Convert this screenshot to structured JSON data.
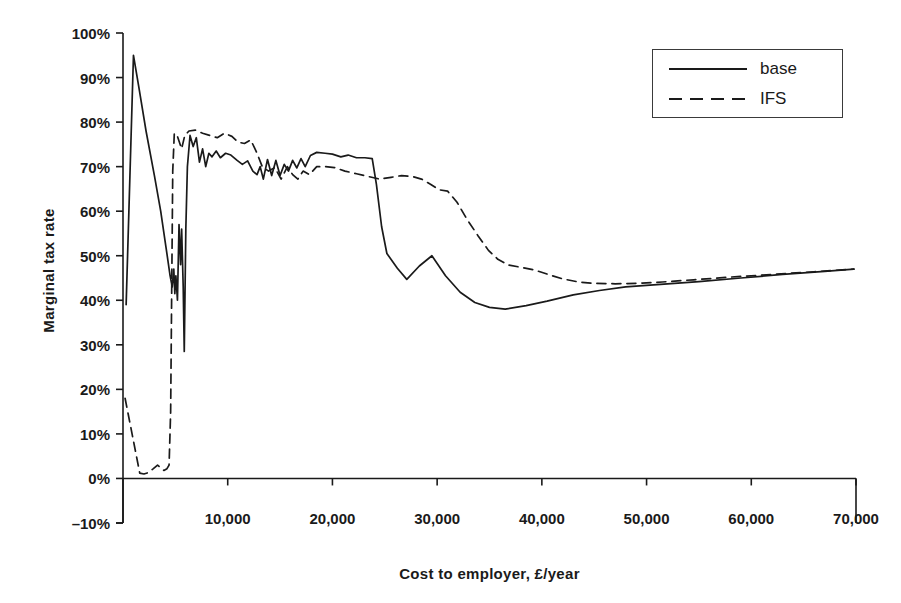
{
  "chart_data": {
    "type": "line",
    "title": "",
    "xlabel": "Cost to employer, £/year",
    "ylabel": "Marginal tax rate",
    "xlim": [
      0,
      70000
    ],
    "ylim": [
      -0.1,
      1.0
    ],
    "grid": false,
    "legend_position": "top-right",
    "x_tick_labels": [
      "10,000",
      "20,000",
      "30,000",
      "40,000",
      "50,000",
      "60,000",
      "70,000"
    ],
    "x_ticks": [
      10000,
      20000,
      30000,
      40000,
      50000,
      60000,
      70000
    ],
    "y_tick_labels": [
      "100%",
      "90%",
      "80%",
      "70%",
      "60%",
      "50%",
      "40%",
      "30%",
      "20%",
      "10%",
      "0%",
      "–10%"
    ],
    "y_ticks": [
      1.0,
      0.9,
      0.8,
      0.7,
      0.6,
      0.5,
      0.4,
      0.3,
      0.2,
      0.1,
      0.0,
      -0.1
    ],
    "series": [
      {
        "name": "base",
        "style": "solid",
        "color": "#1a1a1a",
        "points": [
          [
            300,
            0.39
          ],
          [
            1000,
            0.95
          ],
          [
            1500,
            0.88
          ],
          [
            2200,
            0.78
          ],
          [
            3000,
            0.68
          ],
          [
            3600,
            0.6
          ],
          [
            4100,
            0.52
          ],
          [
            4500,
            0.455
          ],
          [
            4700,
            0.43
          ],
          [
            4850,
            0.47
          ],
          [
            4950,
            0.415
          ],
          [
            5050,
            0.455
          ],
          [
            5200,
            0.4
          ],
          [
            5350,
            0.57
          ],
          [
            5500,
            0.48
          ],
          [
            5600,
            0.56
          ],
          [
            5750,
            0.43
          ],
          [
            5850,
            0.285
          ],
          [
            6000,
            0.56
          ],
          [
            6150,
            0.7
          ],
          [
            6400,
            0.77
          ],
          [
            6700,
            0.745
          ],
          [
            7000,
            0.765
          ],
          [
            7300,
            0.71
          ],
          [
            7600,
            0.74
          ],
          [
            7900,
            0.7
          ],
          [
            8200,
            0.73
          ],
          [
            8500,
            0.722
          ],
          [
            8900,
            0.735
          ],
          [
            9300,
            0.72
          ],
          [
            9800,
            0.73
          ],
          [
            10300,
            0.726
          ],
          [
            10900,
            0.714
          ],
          [
            11400,
            0.705
          ],
          [
            11900,
            0.713
          ],
          [
            12400,
            0.69
          ],
          [
            12800,
            0.682
          ],
          [
            13100,
            0.7
          ],
          [
            13400,
            0.672
          ],
          [
            13800,
            0.716
          ],
          [
            14200,
            0.68
          ],
          [
            14600,
            0.714
          ],
          [
            15000,
            0.68
          ],
          [
            15400,
            0.705
          ],
          [
            15800,
            0.69
          ],
          [
            16200,
            0.714
          ],
          [
            16600,
            0.697
          ],
          [
            17000,
            0.718
          ],
          [
            17400,
            0.7
          ],
          [
            17900,
            0.725
          ],
          [
            18500,
            0.732
          ],
          [
            19300,
            0.73
          ],
          [
            20000,
            0.728
          ],
          [
            20800,
            0.722
          ],
          [
            21500,
            0.726
          ],
          [
            22300,
            0.72
          ],
          [
            23100,
            0.72
          ],
          [
            23800,
            0.718
          ],
          [
            24200,
            0.66
          ],
          [
            24700,
            0.565
          ],
          [
            25200,
            0.505
          ],
          [
            26200,
            0.472
          ],
          [
            27100,
            0.447
          ],
          [
            28300,
            0.477
          ],
          [
            29500,
            0.5
          ],
          [
            30800,
            0.455
          ],
          [
            32200,
            0.418
          ],
          [
            33600,
            0.395
          ],
          [
            35000,
            0.384
          ],
          [
            36500,
            0.38
          ],
          [
            38500,
            0.388
          ],
          [
            40500,
            0.398
          ],
          [
            43000,
            0.412
          ],
          [
            45500,
            0.422
          ],
          [
            48000,
            0.43
          ],
          [
            51000,
            0.435
          ],
          [
            55000,
            0.442
          ],
          [
            59000,
            0.45
          ],
          [
            63000,
            0.458
          ],
          [
            67000,
            0.465
          ],
          [
            69800,
            0.47
          ]
        ]
      },
      {
        "name": "IFS",
        "style": "dashed",
        "color": "#1a1a1a",
        "points": [
          [
            200,
            0.18
          ],
          [
            700,
            0.12
          ],
          [
            1200,
            0.06
          ],
          [
            1600,
            0.012
          ],
          [
            2000,
            0.01
          ],
          [
            2400,
            0.013
          ],
          [
            2900,
            0.022
          ],
          [
            3300,
            0.03
          ],
          [
            3600,
            0.024
          ],
          [
            3900,
            0.018
          ],
          [
            4200,
            0.022
          ],
          [
            4400,
            0.03
          ],
          [
            4550,
            0.15
          ],
          [
            4650,
            0.42
          ],
          [
            4750,
            0.69
          ],
          [
            4900,
            0.775
          ],
          [
            5200,
            0.768
          ],
          [
            5600,
            0.74
          ],
          [
            5900,
            0.77
          ],
          [
            6300,
            0.78
          ],
          [
            6900,
            0.782
          ],
          [
            7600,
            0.775
          ],
          [
            8300,
            0.77
          ],
          [
            9000,
            0.765
          ],
          [
            9700,
            0.775
          ],
          [
            10400,
            0.768
          ],
          [
            11000,
            0.755
          ],
          [
            11600,
            0.752
          ],
          [
            12200,
            0.76
          ],
          [
            12800,
            0.73
          ],
          [
            13300,
            0.7
          ],
          [
            13900,
            0.69
          ],
          [
            14500,
            0.698
          ],
          [
            15100,
            0.672
          ],
          [
            15700,
            0.7
          ],
          [
            16200,
            0.682
          ],
          [
            16700,
            0.672
          ],
          [
            17200,
            0.69
          ],
          [
            17800,
            0.682
          ],
          [
            18500,
            0.7
          ],
          [
            19300,
            0.7
          ],
          [
            20200,
            0.698
          ],
          [
            21200,
            0.69
          ],
          [
            22300,
            0.684
          ],
          [
            23400,
            0.678
          ],
          [
            24500,
            0.672
          ],
          [
            25600,
            0.676
          ],
          [
            26600,
            0.68
          ],
          [
            27600,
            0.678
          ],
          [
            28500,
            0.672
          ],
          [
            29400,
            0.66
          ],
          [
            30200,
            0.648
          ],
          [
            31000,
            0.645
          ],
          [
            31900,
            0.62
          ],
          [
            32900,
            0.58
          ],
          [
            33900,
            0.545
          ],
          [
            34900,
            0.512
          ],
          [
            35800,
            0.492
          ],
          [
            36800,
            0.479
          ],
          [
            38000,
            0.474
          ],
          [
            39300,
            0.468
          ],
          [
            40600,
            0.458
          ],
          [
            42000,
            0.448
          ],
          [
            43500,
            0.441
          ],
          [
            45000,
            0.438
          ],
          [
            47000,
            0.437
          ],
          [
            49000,
            0.438
          ],
          [
            51500,
            0.441
          ],
          [
            54500,
            0.446
          ],
          [
            58000,
            0.452
          ],
          [
            62000,
            0.458
          ],
          [
            66000,
            0.464
          ],
          [
            69800,
            0.47
          ]
        ]
      }
    ]
  },
  "legend": {
    "items": [
      {
        "label": "base",
        "style": "solid"
      },
      {
        "label": "IFS",
        "style": "dashed"
      }
    ]
  },
  "axes": {
    "x_title": "Cost to employer, £/year",
    "y_title": "Marginal tax rate"
  }
}
